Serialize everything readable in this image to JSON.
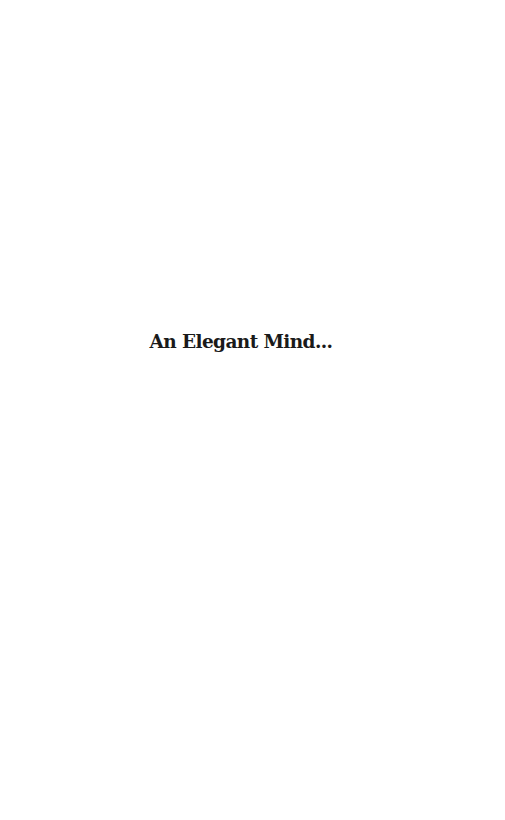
{
  "page": {
    "background_color": "#ffffff",
    "heading": {
      "text": "An Elegant Mind...",
      "color": "#1a1a1a"
    }
  }
}
